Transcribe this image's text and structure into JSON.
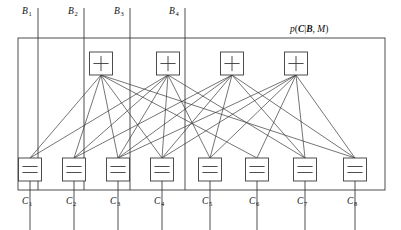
{
  "figure": {
    "type": "factor-graph",
    "title_label": "p(C|B, M)",
    "title_parts": {
      "p": "p",
      "open": "(",
      "C": "C",
      "bar": "|",
      "B": "B",
      "comma": ", ",
      "M": "M",
      "close": ")"
    },
    "outer_box": {
      "x": 18,
      "y": 38,
      "width": 367,
      "height": 152
    },
    "stroke_color": "#3a3a3a",
    "text_color": "#111111",
    "background": "#ffffff"
  },
  "top_variables": {
    "name": "B",
    "count": 4,
    "nodes": [
      {
        "label": "B",
        "sub": "1",
        "x": 38,
        "label_x": 22,
        "label_y": 14
      },
      {
        "label": "B",
        "sub": "2",
        "x": 84,
        "label_x": 68,
        "label_y": 14
      },
      {
        "label": "B",
        "sub": "3",
        "x": 130,
        "label_x": 114,
        "label_y": 14
      },
      {
        "label": "B",
        "sub": "4",
        "x": 185,
        "label_x": 169,
        "label_y": 14
      }
    ],
    "line_top_y": 8,
    "line_bottom_y": 190
  },
  "check_nodes": {
    "symbol": "+",
    "count": 4,
    "box_width": 23,
    "box_height": 23,
    "y": 52,
    "nodes": [
      {
        "id": "f1",
        "symbol": "+",
        "cx": 101
      },
      {
        "id": "f2",
        "symbol": "+",
        "cx": 168
      },
      {
        "id": "f3",
        "symbol": "+",
        "cx": 232
      },
      {
        "id": "f4",
        "symbol": "+",
        "cx": 296
      }
    ]
  },
  "variable_nodes": {
    "symbol": "=",
    "count": 8,
    "box_width": 23,
    "box_height": 23,
    "y": 158,
    "nodes": [
      {
        "id": "c1",
        "label": "C",
        "sub": "1",
        "cx": 30,
        "label_x": 22,
        "label_y": 204
      },
      {
        "id": "c2",
        "label": "C",
        "sub": "2",
        "cx": 74,
        "label_x": 66,
        "label_y": 204
      },
      {
        "id": "c3",
        "label": "C",
        "sub": "3",
        "cx": 118,
        "label_x": 110,
        "label_y": 204
      },
      {
        "id": "c4",
        "label": "C",
        "sub": "4",
        "cx": 162,
        "label_x": 154,
        "label_y": 204
      },
      {
        "id": "c5",
        "label": "C",
        "sub": "5",
        "cx": 210,
        "label_x": 202,
        "label_y": 204
      },
      {
        "id": "c6",
        "label": "C",
        "sub": "6",
        "cx": 257,
        "label_x": 249,
        "label_y": 204
      },
      {
        "id": "c7",
        "label": "C",
        "sub": "7",
        "cx": 305,
        "label_x": 297,
        "label_y": 204
      },
      {
        "id": "c8",
        "label": "C",
        "sub": "8",
        "cx": 355,
        "label_x": 347,
        "label_y": 204
      }
    ],
    "stem_top_y": 181,
    "stem_bottom_y": 230
  },
  "edges": [
    {
      "from": "f1",
      "to": "c1"
    },
    {
      "from": "f1",
      "to": "c2"
    },
    {
      "from": "f1",
      "to": "c3"
    },
    {
      "from": "f1",
      "to": "c4"
    },
    {
      "from": "f1",
      "to": "c6"
    },
    {
      "from": "f1",
      "to": "c8"
    },
    {
      "from": "f2",
      "to": "c1"
    },
    {
      "from": "f2",
      "to": "c2"
    },
    {
      "from": "f2",
      "to": "c3"
    },
    {
      "from": "f2",
      "to": "c4"
    },
    {
      "from": "f2",
      "to": "c5"
    },
    {
      "from": "f2",
      "to": "c7"
    },
    {
      "from": "f3",
      "to": "c2"
    },
    {
      "from": "f3",
      "to": "c3"
    },
    {
      "from": "f3",
      "to": "c4"
    },
    {
      "from": "f3",
      "to": "c5"
    },
    {
      "from": "f3",
      "to": "c7"
    },
    {
      "from": "f3",
      "to": "c8"
    },
    {
      "from": "f4",
      "to": "c3"
    },
    {
      "from": "f4",
      "to": "c4"
    },
    {
      "from": "f4",
      "to": "c5"
    },
    {
      "from": "f4",
      "to": "c6"
    },
    {
      "from": "f4",
      "to": "c7"
    },
    {
      "from": "f4",
      "to": "c8"
    }
  ]
}
